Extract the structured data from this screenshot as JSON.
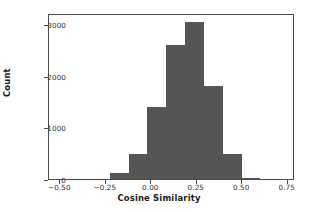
{
  "chart_data": {
    "type": "bar",
    "title": "",
    "subtitle": "",
    "xlabel": "Cosine Similarity",
    "ylabel": "Count",
    "xlim": [
      -0.5625,
      0.79
    ],
    "ylim": [
      0,
      3210
    ],
    "grid": false,
    "legend": null,
    "bin_width": 0.1035,
    "bin_edges": [
      -0.2225,
      -0.119,
      -0.0155,
      0.088,
      0.1915,
      0.295,
      0.3985,
      0.502,
      0.6055
    ],
    "categories": [
      "-0.22 to -0.12",
      "-0.12 to -0.02",
      "-0.02 to 0.09",
      "0.09 to 0.19",
      "0.19 to 0.30",
      "0.30 to 0.40",
      "0.40 to 0.50",
      "0.50 to 0.61"
    ],
    "values": [
      110,
      480,
      1400,
      2600,
      3040,
      1790,
      480,
      20
    ],
    "bar_color": "#555555",
    "axis_color": "#4d4d4d",
    "xticks": [
      {
        "value": -0.5,
        "label": "−0.50"
      },
      {
        "value": -0.25,
        "label": "−0.25"
      },
      {
        "value": 0.0,
        "label": "0.00"
      },
      {
        "value": 0.25,
        "label": "0.25"
      },
      {
        "value": 0.5,
        "label": "0.50"
      },
      {
        "value": 0.75,
        "label": "0.75"
      }
    ],
    "yticks": [
      {
        "value": 0,
        "label": "0"
      },
      {
        "value": 1000,
        "label": "1000"
      },
      {
        "value": 2000,
        "label": "2000"
      },
      {
        "value": 3000,
        "label": "3000"
      }
    ]
  }
}
